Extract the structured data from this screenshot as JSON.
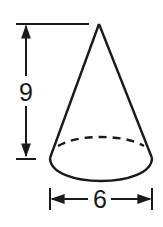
{
  "figure": {
    "shape": "cone",
    "stroke_color": "#1a1a1a",
    "background": "#ffffff"
  },
  "dimensions": {
    "height": {
      "label": "9",
      "orientation": "vertical"
    },
    "diameter": {
      "label": "6",
      "orientation": "horizontal"
    }
  }
}
